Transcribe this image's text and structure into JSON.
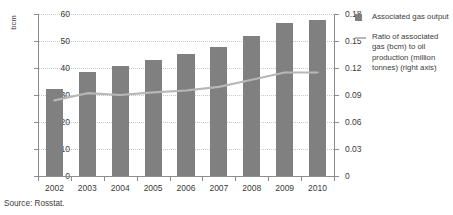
{
  "source_note": "Source: Rosstat.",
  "legend": {
    "items": [
      {
        "marker": "square-swatch",
        "label": "Associated gas output"
      },
      {
        "marker": "line-swatch",
        "label": "Ratio of associated gas (bcm) to oil production (million tonnes) (right axis)"
      }
    ]
  },
  "colors": {
    "bar": "#808080",
    "line": "#b7b7b7",
    "axis": "#8c8c8c",
    "grid": "#c8c8c8",
    "text": "#3b3b3b",
    "background": "#ffffff"
  },
  "axes": {
    "left_title": "bcm",
    "left_ticks": [
      "0",
      "10",
      "20",
      "30",
      "40",
      "50",
      "60"
    ],
    "right_ticks": [
      "0",
      "0.03",
      "0.06",
      "0.09",
      "0.12",
      "0.15",
      "0.18"
    ]
  },
  "chart_data": {
    "type": "bar",
    "title": "",
    "xlabel": "",
    "ylabel": "bcm",
    "categories": [
      "2002",
      "2003",
      "2004",
      "2005",
      "2006",
      "2007",
      "2008",
      "2009",
      "2010"
    ],
    "ylim": [
      0,
      60
    ],
    "y2lim": [
      0,
      0.18
    ],
    "y_ticks": [
      0,
      10,
      20,
      30,
      40,
      50,
      60
    ],
    "y2_ticks": [
      0,
      0.03,
      0.06,
      0.09,
      0.12,
      0.15,
      0.18
    ],
    "grid": true,
    "legend_position": "right",
    "series": [
      {
        "name": "Associated gas output",
        "type": "bar",
        "axis": "left",
        "unit": "bcm",
        "values": [
          32.2,
          38.6,
          40.8,
          43.0,
          45.3,
          47.8,
          51.8,
          56.8,
          57.8
        ]
      },
      {
        "name": "Ratio of associated gas (bcm) to oil production (million tonnes) (right axis)",
        "type": "line",
        "axis": "right",
        "values": [
          0.084,
          0.092,
          0.09,
          0.093,
          0.095,
          0.099,
          0.107,
          0.115,
          0.115
        ]
      }
    ]
  }
}
